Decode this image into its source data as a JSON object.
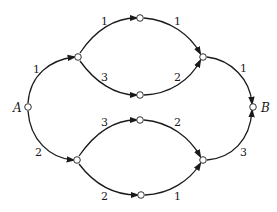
{
  "diagram": {
    "type": "directed-weighted-graph",
    "nodes": [
      {
        "id": "A",
        "label": "A",
        "x": 28,
        "y": 107
      },
      {
        "id": "u1",
        "label": "",
        "x": 78,
        "y": 57
      },
      {
        "id": "t",
        "label": "",
        "x": 140,
        "y": 18
      },
      {
        "id": "m1",
        "label": "",
        "x": 140,
        "y": 95
      },
      {
        "id": "u2",
        "label": "",
        "x": 203,
        "y": 57
      },
      {
        "id": "B",
        "label": "B",
        "x": 253,
        "y": 107
      },
      {
        "id": "l1",
        "label": "",
        "x": 77,
        "y": 160
      },
      {
        "id": "m2",
        "label": "",
        "x": 140,
        "y": 120
      },
      {
        "id": "b",
        "label": "",
        "x": 141,
        "y": 195
      },
      {
        "id": "l2",
        "label": "",
        "x": 203,
        "y": 160
      }
    ],
    "edges": [
      {
        "from": "A",
        "to": "u1",
        "weight": "1"
      },
      {
        "from": "u1",
        "to": "t",
        "weight": "1"
      },
      {
        "from": "u1",
        "to": "m1",
        "weight": "3"
      },
      {
        "from": "t",
        "to": "u2",
        "weight": "1"
      },
      {
        "from": "m1",
        "to": "u2",
        "weight": "2"
      },
      {
        "from": "u2",
        "to": "B",
        "weight": "1"
      },
      {
        "from": "A",
        "to": "l1",
        "weight": "2"
      },
      {
        "from": "l1",
        "to": "m2",
        "weight": "3"
      },
      {
        "from": "l1",
        "to": "b",
        "weight": "2"
      },
      {
        "from": "m2",
        "to": "l2",
        "weight": "2"
      },
      {
        "from": "b",
        "to": "l2",
        "weight": "1"
      },
      {
        "from": "l2",
        "to": "B",
        "weight": "3"
      }
    ]
  }
}
